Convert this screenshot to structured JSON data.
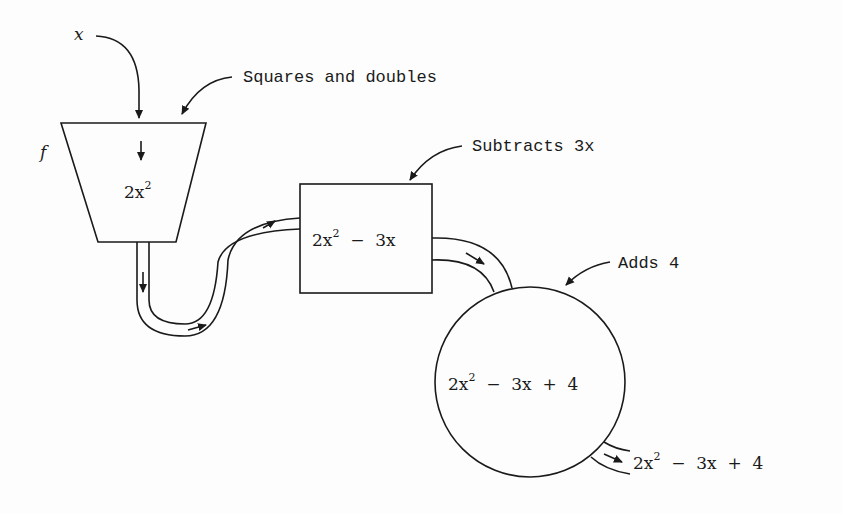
{
  "diagram": {
    "input_label": "x",
    "function_label": "f",
    "stages": [
      {
        "name": "squares-and-doubles",
        "annotation": "Squares and doubles",
        "shape": "trapezoid",
        "expr_main": "2x",
        "expr_sup": "2",
        "expr_rest": ""
      },
      {
        "name": "subtracts-3x",
        "annotation": "Subtracts 3x",
        "shape": "rectangle",
        "expr_main": "2x",
        "expr_sup": "2",
        "expr_rest": "  −  3x"
      },
      {
        "name": "adds-4",
        "annotation": "Adds 4",
        "shape": "circle",
        "expr_main": "2x",
        "expr_sup": "2",
        "expr_rest": "  −  3x  +  4"
      }
    ],
    "output": {
      "expr_main": "2x",
      "expr_sup": "2",
      "expr_rest": "  −  3x  +  4"
    }
  }
}
